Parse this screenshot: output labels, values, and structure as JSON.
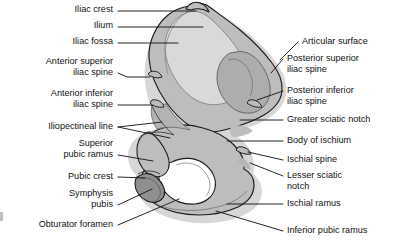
{
  "figure": {
    "width": 397,
    "height": 247,
    "background_color": "#ffffff",
    "line_color": "#1a1a1a",
    "text_color": "#111111"
  },
  "bone": {
    "name": "hip-bone-medial-view",
    "regions": [
      {
        "id": "ilium-body",
        "label": "Ilium",
        "fill": "#bdbdbd"
      },
      {
        "id": "iliac-fossa",
        "label": "Iliac fossa",
        "fill": "#d9d9d9"
      },
      {
        "id": "articular-surface",
        "label": "Articular surface",
        "fill": "#adadad"
      },
      {
        "id": "symphysis-pubis",
        "label": "Symphysis pubis",
        "fill": "#8f8f8f"
      },
      {
        "id": "obturator-foramen",
        "label": "Obturator foramen",
        "fill": "#ffffff"
      }
    ],
    "outline_color": "#1a1a1a",
    "inner_line_color": "#6b6b6b"
  },
  "labels_left": [
    {
      "id": "iliac-crest",
      "lines": [
        "Iliac crest"
      ],
      "x": 113,
      "y": 8,
      "leader": [
        [
          118,
          11
        ],
        [
          196,
          11
        ]
      ]
    },
    {
      "id": "ilium",
      "lines": [
        "Ilium"
      ],
      "x": 113,
      "y": 24,
      "leader": [
        [
          118,
          27
        ],
        [
          203,
          27
        ]
      ]
    },
    {
      "id": "iliac-fossa",
      "lines": [
        "Iliac fossa"
      ],
      "x": 113,
      "y": 40,
      "leader": [
        [
          118,
          43
        ],
        [
          178,
          43
        ]
      ]
    },
    {
      "id": "anterior-superior-iliac-spine",
      "lines": [
        "Anterior superior",
        "iliac spine"
      ],
      "x": 113,
      "y": 58,
      "leader": [
        [
          118,
          73
        ],
        [
          128,
          77
        ],
        [
          150,
          77
        ]
      ]
    },
    {
      "id": "anterior-inferior-iliac-spine",
      "lines": [
        "Anterior inferior",
        "iliac spine"
      ],
      "x": 113,
      "y": 90,
      "leader": [
        [
          118,
          105
        ],
        [
          152,
          105
        ]
      ]
    },
    {
      "id": "iliopectineal-line",
      "lines": [
        "Iliopectineal line"
      ],
      "x": 113,
      "y": 124,
      "leader": [
        [
          118,
          127
        ],
        [
          160,
          123
        ]
      ],
      "leader2": [
        [
          118,
          127
        ],
        [
          168,
          137
        ]
      ]
    },
    {
      "id": "superior-pubic-ramus",
      "lines": [
        "Superior",
        "pubic ramus"
      ],
      "x": 113,
      "y": 140,
      "leader": [
        [
          118,
          155
        ],
        [
          152,
          160
        ]
      ]
    },
    {
      "id": "pubic-crest",
      "lines": [
        "Pubic crest"
      ],
      "x": 113,
      "y": 174,
      "leader": [
        [
          118,
          177
        ],
        [
          146,
          178
        ]
      ]
    },
    {
      "id": "symphysis-pubis",
      "lines": [
        "Symphysis",
        "pubis"
      ],
      "x": 113,
      "y": 190,
      "leader": [
        [
          118,
          205
        ],
        [
          154,
          190
        ]
      ]
    },
    {
      "id": "obturator-foramen",
      "lines": [
        "Obturator foramen"
      ],
      "x": 113,
      "y": 222,
      "leader": [
        [
          118,
          225
        ],
        [
          178,
          200
        ]
      ]
    }
  ],
  "labels_right": [
    {
      "id": "articular-surface",
      "lines": [
        "Articular surface"
      ],
      "x": 302,
      "y": 39,
      "leader": [
        [
          298,
          42
        ],
        [
          281,
          60
        ]
      ]
    },
    {
      "id": "posterior-superior-iliac-spine",
      "lines": [
        "Posterior superior",
        "iliac spine"
      ],
      "x": 287,
      "y": 56,
      "leader": [
        [
          283,
          59
        ],
        [
          272,
          72
        ]
      ]
    },
    {
      "id": "posterior-inferior-iliac-spine",
      "lines": [
        "Posterior inferior",
        "iliac spine"
      ],
      "x": 287,
      "y": 88,
      "leader": [
        [
          283,
          91
        ],
        [
          258,
          99
        ]
      ]
    },
    {
      "id": "greater-sciatic-notch",
      "lines": [
        "Greater sciatic notch"
      ],
      "x": 287,
      "y": 117,
      "leader": [
        [
          283,
          120
        ],
        [
          241,
          120
        ]
      ]
    },
    {
      "id": "body-of-ischium",
      "lines": [
        "Body of ischium"
      ],
      "x": 287,
      "y": 138,
      "leader": [
        [
          283,
          141
        ],
        [
          228,
          141
        ]
      ]
    },
    {
      "id": "ischial-spine",
      "lines": [
        "Ischial spine"
      ],
      "x": 287,
      "y": 157,
      "leader": [
        [
          283,
          160
        ],
        [
          247,
          152
        ]
      ]
    },
    {
      "id": "lesser-sciatic-notch",
      "lines": [
        "Lesser sciatic",
        "notch"
      ],
      "x": 287,
      "y": 173,
      "leader": [
        [
          283,
          176
        ],
        [
          249,
          163
        ]
      ]
    },
    {
      "id": "ischial-ramus",
      "lines": [
        "Ischial ramus"
      ],
      "x": 287,
      "y": 201,
      "leader": [
        [
          283,
          204
        ],
        [
          228,
          204
        ]
      ]
    },
    {
      "id": "inferior-pubic-ramus",
      "lines": [
        "Inferior pubic ramus"
      ],
      "x": 287,
      "y": 228,
      "leader": [
        [
          283,
          231
        ],
        [
          217,
          212
        ]
      ]
    }
  ]
}
